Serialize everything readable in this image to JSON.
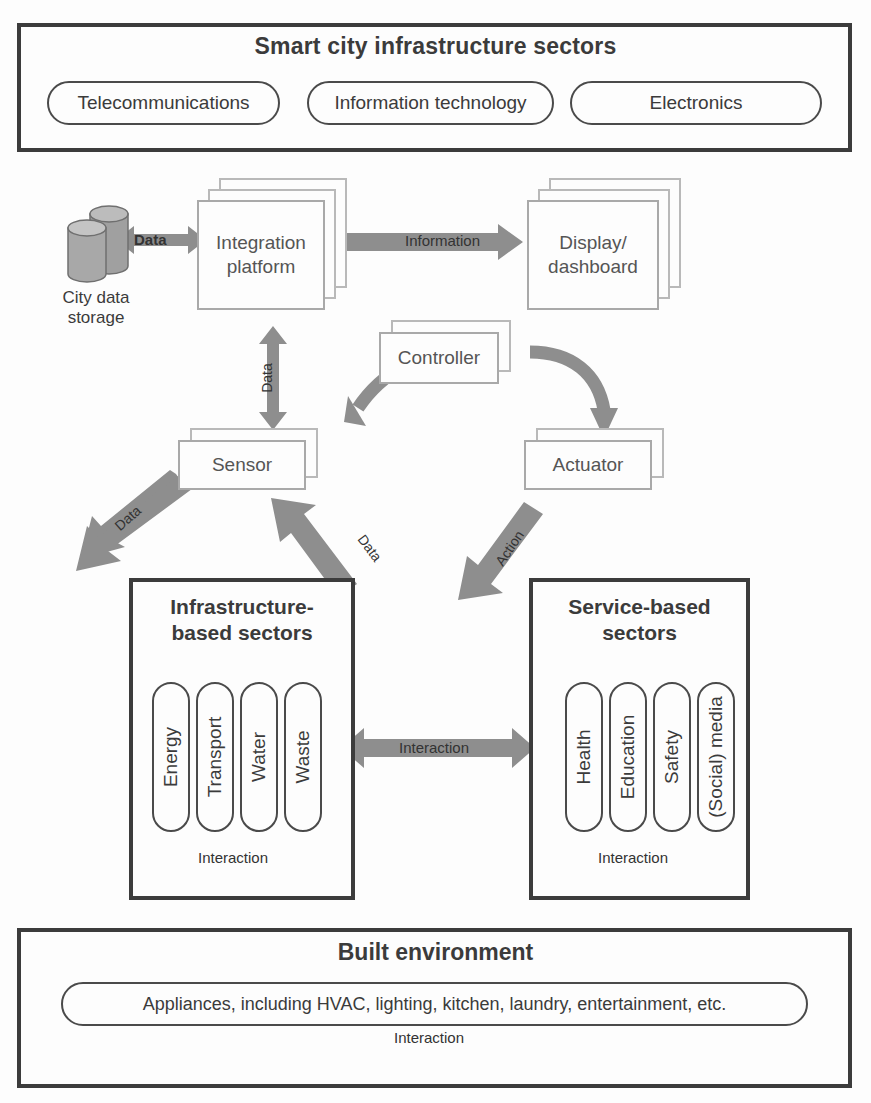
{
  "diagram": {
    "accent_gray": "#8e8e8e",
    "line_gray": "#b9b9b9",
    "frame_dark": "#3c3c3c"
  },
  "top_panel": {
    "title": "Smart city infrastructure sectors",
    "pills": [
      {
        "label": "Telecommunications"
      },
      {
        "label": "Information technology"
      },
      {
        "label": "Electronics"
      }
    ]
  },
  "flow": {
    "city_storage": {
      "label_line1": "City data",
      "label_line2": "storage",
      "icon": "database-cylinders-icon"
    },
    "nodes": [
      {
        "id": "integration-platform",
        "label": "Integration platform",
        "line1": "Integration",
        "line2": "platform",
        "layers": 3
      },
      {
        "id": "display-dashboard",
        "label": "Display/ dashboard",
        "line1": "Display/",
        "line2": "dashboard",
        "layers": 3
      },
      {
        "id": "controller",
        "label": "Controller",
        "line1": "Controller",
        "line2": "",
        "layers": 2
      },
      {
        "id": "sensor",
        "label": "Sensor",
        "line1": "Sensor",
        "line2": "",
        "layers": 2
      },
      {
        "id": "actuator",
        "label": "Actuator",
        "line1": "Actuator",
        "line2": "",
        "layers": 2
      }
    ],
    "connectors": [
      {
        "id": "storage-platform",
        "label": "Data",
        "from": "city-data-storage",
        "to": "integration-platform",
        "direction": "bidirectional"
      },
      {
        "id": "platform-display",
        "label": "Information",
        "from": "integration-platform",
        "to": "display-dashboard",
        "direction": "forward"
      },
      {
        "id": "platform-sensor",
        "label": "Data",
        "from": "integration-platform",
        "to": "sensor",
        "direction": "bidirectional"
      },
      {
        "id": "controller-sensor",
        "label": "",
        "from": "controller",
        "to": "sensor",
        "direction": "forward"
      },
      {
        "id": "controller-actuator",
        "label": "",
        "from": "controller",
        "to": "actuator",
        "direction": "forward"
      },
      {
        "id": "sensor-storage",
        "label": "Data",
        "from": "sensor",
        "to": "city-data-storage",
        "direction": "forward"
      },
      {
        "id": "sectors-sensor",
        "label": "Data",
        "from": "infrastructure-sectors",
        "to": "sensor",
        "direction": "forward"
      },
      {
        "id": "actuator-sectors",
        "label": "Action",
        "from": "actuator",
        "to": "service-sectors",
        "direction": "forward"
      }
    ]
  },
  "infrastructure_panel": {
    "title_line1": "Infrastructure-",
    "title_line2": "based sectors",
    "title": "Infrastructure-based sectors",
    "items": [
      {
        "label": "Energy"
      },
      {
        "label": "Transport"
      },
      {
        "label": "Water"
      },
      {
        "label": "Waste"
      }
    ],
    "interaction_label": "Interaction"
  },
  "service_panel": {
    "title_line1": "Service-based",
    "title_line2": "sectors",
    "title": "Service-based sectors",
    "items": [
      {
        "label": "Health"
      },
      {
        "label": "Education"
      },
      {
        "label": "Safety"
      },
      {
        "label": "(Social) media"
      }
    ],
    "interaction_label": "Interaction"
  },
  "between_panels": {
    "interaction_label": "Interaction"
  },
  "built_environment": {
    "title": "Built environment",
    "pill_label": "Appliances, including HVAC, lighting, kitchen, laundry, entertainment, etc.",
    "interaction_label": "Interaction"
  }
}
